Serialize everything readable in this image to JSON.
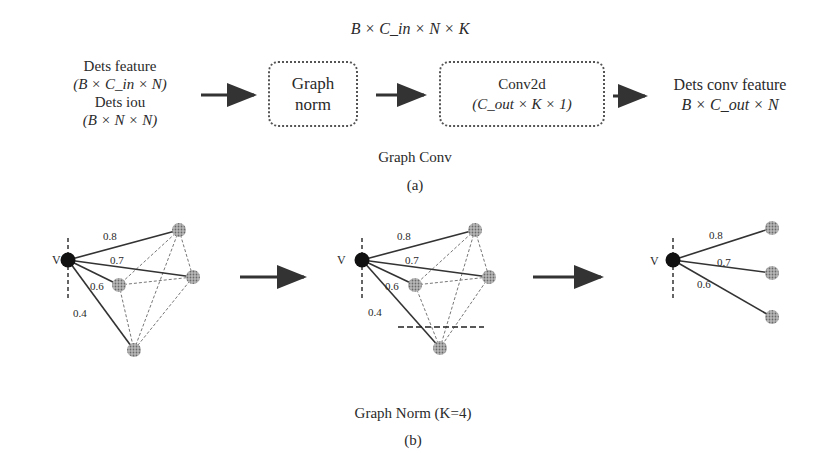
{
  "part_a": {
    "top_dim": "B × C_in × N × K",
    "input": {
      "line1": "Dets feature",
      "line2": "(B × C_in × N)",
      "line3": "Dets iou",
      "line4": "(B × N × N)"
    },
    "graph_norm_box": {
      "line1": "Graph",
      "line2": "norm"
    },
    "conv_box": {
      "line1": "Conv2d",
      "line2": "(C_out × K × 1)"
    },
    "output": {
      "line1": "Dets conv feature",
      "line2": "B × C_out × N"
    },
    "group_label": "Graph Conv",
    "caption": "(a)"
  },
  "part_b": {
    "graphs": [
      {
        "node_label": "V",
        "edge_weights": [
          "0.8",
          "0.7",
          "0.6",
          "0.4"
        ]
      },
      {
        "node_label": "V",
        "edge_weights": [
          "0.8",
          "0.7",
          "0.6",
          "0.4"
        ]
      },
      {
        "node_label": "V",
        "edge_weights": [
          "0.8",
          "0.7",
          "0.6"
        ]
      }
    ],
    "title": "Graph Norm (K=4)",
    "caption": "(b)"
  },
  "colors": {
    "text": "#2a2a2a",
    "center_node": "#111111",
    "neighbor_node": "#9a9a9a",
    "edge": "#333333",
    "dashed_edge": "#777777"
  }
}
